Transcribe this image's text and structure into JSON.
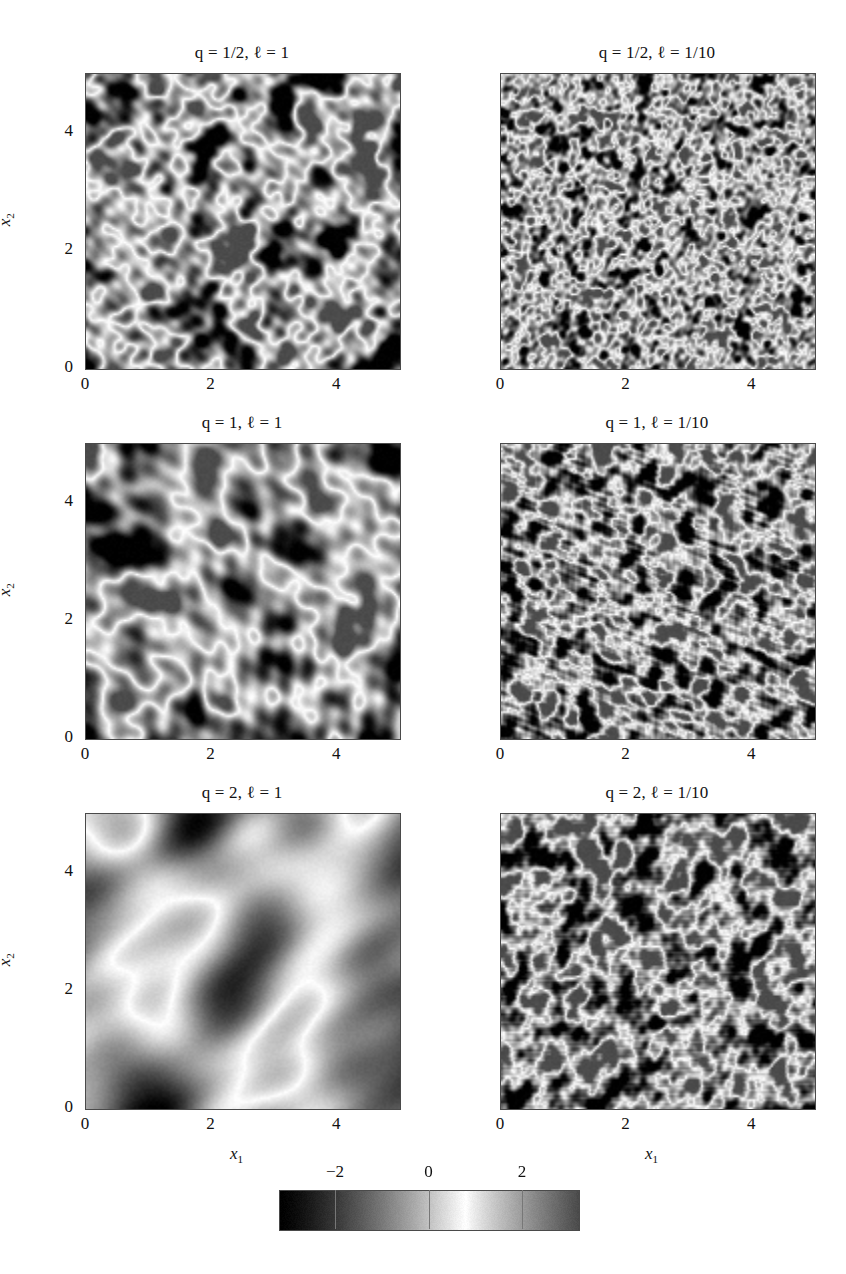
{
  "figure": {
    "type": "random-field-realizations",
    "background": "#ffffff",
    "width": 846,
    "height": 1274
  },
  "chart_data": {
    "type": "heatmap",
    "title": "",
    "xlabel": "x1",
    "ylabel": "x2",
    "grid": false,
    "legend_position": "bottom",
    "xlim": [
      0,
      5
    ],
    "ylim": [
      0,
      5
    ],
    "xticks": [
      0,
      2,
      4
    ],
    "yticks": [
      0,
      2,
      4
    ],
    "xticklabels": [
      "0",
      "2",
      "4"
    ],
    "yticklabels": [
      "0",
      "2",
      "4"
    ],
    "colorbar": {
      "label": "",
      "ticks": [
        -2,
        0,
        2
      ],
      "ticklabels": [
        "−2",
        "0",
        "2"
      ],
      "vmin": -3.2,
      "vmax": 3.2,
      "colormap": "grayscale-nonmonotonic-bright-at-plus-0.7"
    },
    "panels": [
      {
        "id": "q-half-l-1",
        "row": 0,
        "col": 0,
        "title": "q = 1/2, ℓ = 1",
        "q": 0.5,
        "ell": 1,
        "seed": 11,
        "lengthscale_px": 34,
        "amplitude": 1.95,
        "roughness": 0.55,
        "mean": 0.1
      },
      {
        "id": "q-half-l-0.1",
        "row": 0,
        "col": 1,
        "title": "q = 1/2, ℓ = 1/10",
        "q": 0.5,
        "ell": 0.1,
        "seed": 22,
        "lengthscale_px": 14,
        "amplitude": 1.85,
        "roughness": 0.55,
        "mean": 0.15
      },
      {
        "id": "q-1-l-1",
        "row": 1,
        "col": 0,
        "title": "q = 1, ℓ = 1",
        "q": 1,
        "ell": 1,
        "seed": 33,
        "lengthscale_px": 46,
        "amplitude": 2.1,
        "roughness": 0.3,
        "mean": 0.0
      },
      {
        "id": "q-1-l-0.1",
        "row": 1,
        "col": 1,
        "title": "q = 1, ℓ = 1/10",
        "q": 1,
        "ell": 0.1,
        "seed": 44,
        "lengthscale_px": 17,
        "amplitude": 2.2,
        "roughness": 0.3,
        "mean": 0.0
      },
      {
        "id": "q-2-l-1",
        "row": 2,
        "col": 0,
        "title": "q = 2, ℓ = 1",
        "q": 2,
        "ell": 1,
        "seed": 55,
        "lengthscale_px": 86,
        "amplitude": 1.15,
        "roughness": 0.08,
        "mean": -0.65
      },
      {
        "id": "q-2-l-0.1",
        "row": 2,
        "col": 1,
        "title": "q = 2, ℓ = 1/10",
        "q": 2,
        "ell": 0.1,
        "seed": 66,
        "lengthscale_px": 19,
        "amplitude": 2.25,
        "roughness": 0.12,
        "mean": 0.05
      }
    ]
  },
  "axes": {
    "x_label_text": "x",
    "x_label_sub": "1",
    "y_label_text": "x",
    "y_label_sub": "2",
    "tick_0": "0",
    "tick_2": "2",
    "tick_4": "4"
  },
  "colorbar_labels": {
    "minus_two": "−2",
    "zero": "0",
    "two": "2"
  }
}
